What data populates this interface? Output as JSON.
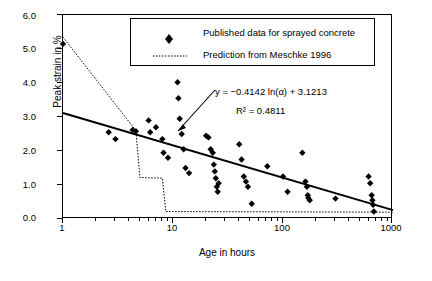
{
  "chart_data": {
    "type": "scatter",
    "title": "",
    "xlabel": "Age in hours",
    "ylabel": "Peak strain in %",
    "xscale": "log",
    "xlim": [
      1,
      1000
    ],
    "ylim": [
      0.0,
      6.0
    ],
    "xticks": [
      "1",
      "10",
      "100",
      "1000"
    ],
    "yticks": [
      "0.0",
      "1.0",
      "2.0",
      "3.0",
      "4.0",
      "5.0",
      "6.0"
    ],
    "grid": false,
    "legend_position": "top-center",
    "legend": [
      {
        "label": "Published data for sprayed concrete",
        "marker": "diamond"
      },
      {
        "label": "Prediction from Meschke 1996",
        "marker": "dotted-line"
      }
    ],
    "annotations": [
      {
        "text": "y = −0.4142 ln(α) + 3.1213",
        "kind": "equation"
      },
      {
        "text": "R² = 0.4811",
        "kind": "r-squared"
      }
    ],
    "series": [
      {
        "name": "Published data for sprayed concrete",
        "type": "scatter",
        "marker": "diamond",
        "points": [
          [
            1.0,
            5.15
          ],
          [
            2.6,
            2.55
          ],
          [
            3.0,
            2.35
          ],
          [
            4.3,
            2.62
          ],
          [
            4.6,
            2.58
          ],
          [
            6.0,
            2.9
          ],
          [
            6.2,
            2.55
          ],
          [
            7.0,
            2.7
          ],
          [
            8.0,
            2.35
          ],
          [
            8.2,
            1.95
          ],
          [
            9.0,
            1.8
          ],
          [
            11.0,
            4.02
          ],
          [
            11.2,
            3.55
          ],
          [
            11.5,
            2.95
          ],
          [
            12.0,
            2.5
          ],
          [
            12.5,
            2.05
          ],
          [
            13.0,
            1.5
          ],
          [
            14.0,
            1.35
          ],
          [
            20.0,
            2.45
          ],
          [
            21.0,
            2.4
          ],
          [
            22.0,
            2.05
          ],
          [
            23.0,
            1.95
          ],
          [
            23.5,
            1.6
          ],
          [
            24.0,
            1.4
          ],
          [
            24.5,
            1.2
          ],
          [
            25.0,
            0.95
          ],
          [
            25.5,
            0.8
          ],
          [
            26.0,
            1.05
          ],
          [
            40.0,
            2.2
          ],
          [
            42.0,
            1.75
          ],
          [
            44.0,
            1.25
          ],
          [
            46.0,
            1.1
          ],
          [
            48.0,
            0.95
          ],
          [
            52.0,
            0.45
          ],
          [
            72.0,
            1.55
          ],
          [
            100.0,
            1.25
          ],
          [
            110.0,
            0.8
          ],
          [
            150.0,
            1.95
          ],
          [
            160.0,
            1.1
          ],
          [
            165.0,
            0.95
          ],
          [
            168.0,
            0.7
          ],
          [
            170.0,
            0.62
          ],
          [
            175.0,
            0.55
          ],
          [
            300.0,
            0.6
          ],
          [
            600.0,
            1.25
          ],
          [
            620.0,
            1.05
          ],
          [
            640.0,
            0.7
          ],
          [
            650.0,
            0.55
          ],
          [
            660.0,
            0.42
          ],
          [
            670.0,
            0.22
          ]
        ]
      },
      {
        "name": "Prediction from Meschke 1996",
        "type": "line",
        "style": "dotted",
        "points": [
          [
            1.0,
            5.35
          ],
          [
            4.6,
            2.6
          ],
          [
            5.0,
            1.22
          ],
          [
            8.0,
            1.2
          ],
          [
            8.6,
            0.22
          ],
          [
            1000.0,
            0.2
          ]
        ]
      },
      {
        "name": "Regression trendline",
        "type": "line",
        "style": "solid",
        "points": [
          [
            1.0,
            3.12
          ],
          [
            1000.0,
            0.26
          ]
        ]
      }
    ]
  }
}
